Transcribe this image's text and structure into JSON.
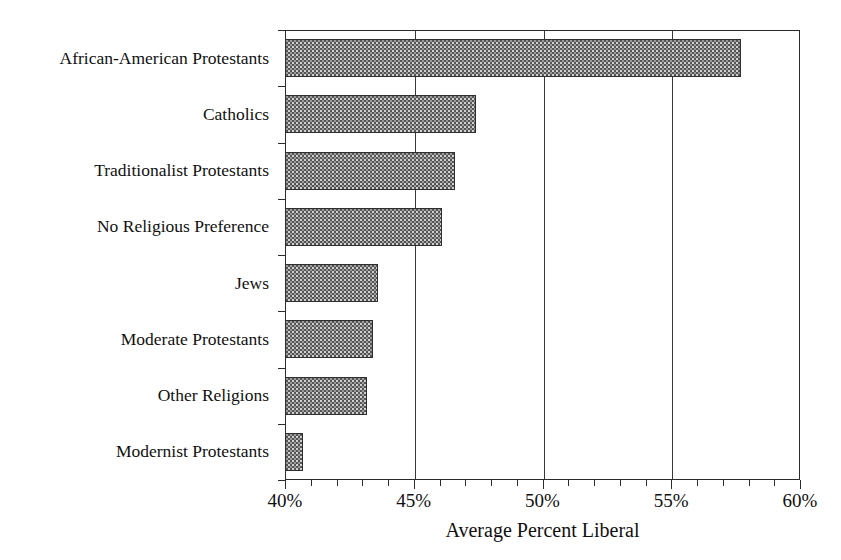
{
  "chart_data": {
    "type": "bar",
    "orientation": "horizontal",
    "title": "",
    "xlabel": "Average Percent Liberal",
    "ylabel": "",
    "xlim": [
      40,
      60
    ],
    "ylim": null,
    "grid": "vertical-major-only",
    "legend": "none",
    "categories": [
      "African-American Protestants",
      "Catholics",
      "Traditionalist Protestants",
      "No Religious Preference",
      "Jews",
      "Moderate Protestants",
      "Other Religions",
      "Modernist Protestants"
    ],
    "values": [
      57.7,
      47.4,
      46.6,
      46.1,
      43.6,
      43.4,
      43.2,
      40.7
    ],
    "value_unit": "percent",
    "bar_baseline": 40,
    "x_ticks_major": [
      40,
      45,
      50,
      55,
      60
    ],
    "x_tick_labels": [
      "40%",
      "45%",
      "50%",
      "55%",
      "60%"
    ],
    "x_ticks_minor_step": 1,
    "gridline_positions": [
      45,
      50,
      55
    ],
    "bar_fill": "#9a9a9a",
    "bar_pattern": "checkerboard-halftone",
    "bar_edge_color": "#2f2f2f",
    "axis_color": "#2b2b2b",
    "background": "#ffffff"
  }
}
